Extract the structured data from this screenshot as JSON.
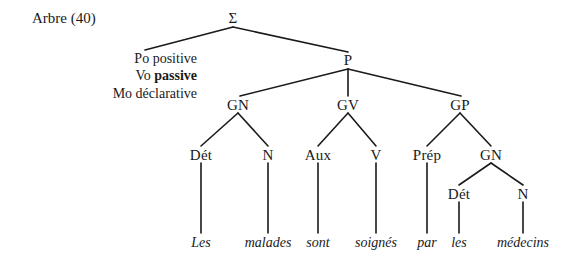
{
  "figure": {
    "caption": "Arbre (40)",
    "background_color": "#ffffff",
    "line_color": "#1a1a1a"
  },
  "features": [
    {
      "key": "Po",
      "value": "positive",
      "bold": false
    },
    {
      "key": "Vo",
      "value": "passive",
      "bold": true
    },
    {
      "key": "Mo",
      "value": "déclarative",
      "bold": false
    }
  ],
  "nodes": {
    "sigma": "Σ",
    "p": "P",
    "gn1": "GN",
    "gv": "GV",
    "gp": "GP",
    "det1": "Dét",
    "n1": "N",
    "aux": "Aux",
    "v": "V",
    "prep": "Prép",
    "gn2": "GN",
    "det2": "Dét",
    "n2": "N"
  },
  "terminals": {
    "les1": "Les",
    "malades": "malades",
    "sont": "sont",
    "soignes": "soignés",
    "par": "par",
    "les2": "les",
    "medecins": "médecins"
  },
  "sentence": "Les malades sont soignés par les médecins"
}
